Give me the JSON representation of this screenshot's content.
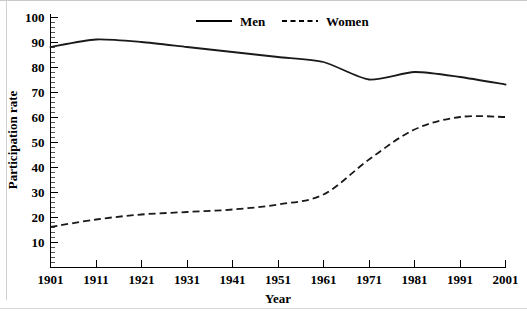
{
  "chart_data": {
    "type": "line",
    "title": "",
    "xlabel": "Year",
    "ylabel": "Participation rate",
    "x": [
      1901,
      1911,
      1921,
      1931,
      1941,
      1951,
      1961,
      1971,
      1981,
      1991,
      2001
    ],
    "xtick_labels": [
      "1901",
      "1911",
      "1921",
      "1931",
      "1941",
      "1951",
      "1961",
      "1971",
      "1981",
      "1991",
      "2001"
    ],
    "ytick_labels": [
      "100",
      "90",
      "80",
      "70",
      "60",
      "50",
      "40",
      "30",
      "20",
      "10"
    ],
    "ytick_values": [
      100,
      90,
      80,
      70,
      60,
      50,
      40,
      30,
      20,
      10
    ],
    "ylim": [
      0,
      100
    ],
    "xlim": [
      1901,
      2001
    ],
    "grid": false,
    "minor_ticks": true,
    "minor_tick_step": 2,
    "legend_position": "top-center",
    "series": [
      {
        "name": "Men",
        "style": "solid",
        "color": "#1a1a1a",
        "values": [
          88,
          91,
          90,
          88,
          86,
          84,
          82,
          75,
          78,
          76,
          73
        ]
      },
      {
        "name": "Women",
        "style": "dashed",
        "color": "#1a1a1a",
        "values": [
          16,
          19,
          21,
          22,
          23,
          25,
          29,
          43,
          55,
          60,
          60
        ]
      }
    ]
  },
  "legend": {
    "items": [
      {
        "label": "Men",
        "style": "solid"
      },
      {
        "label": "Women",
        "style": "dashed"
      }
    ]
  },
  "axes": {
    "x_title": "Year",
    "y_title": "Participation rate"
  }
}
